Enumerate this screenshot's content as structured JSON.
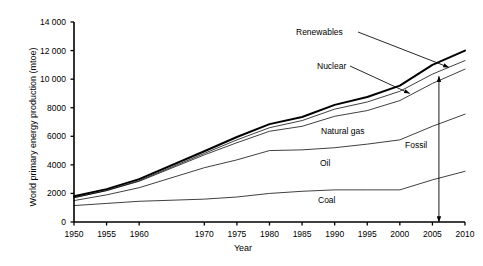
{
  "chart_data": {
    "type": "line",
    "title": "",
    "subtitle": "",
    "xlabel": "Year",
    "ylabel": "World primary energy production (mtoe)",
    "xlim": [
      1950,
      2010
    ],
    "ylim": [
      0,
      14000
    ],
    "grid": false,
    "legend_position": "inline-labels",
    "stacking": "cumulative",
    "x": [
      1950,
      1955,
      1960,
      1970,
      1975,
      1980,
      1985,
      1990,
      1995,
      2000,
      2005,
      2010
    ],
    "xticklabels": [
      "1950",
      "1955",
      "1960",
      "1970",
      "1975",
      "1980",
      "1985",
      "1990",
      "1995",
      "2000",
      "2005",
      "2010"
    ],
    "yticks": [
      0,
      2000,
      4000,
      6000,
      8000,
      10000,
      12000,
      14000
    ],
    "yticklabels": [
      "0",
      "2000",
      "4000",
      "6000",
      "8000",
      "10 000",
      "12 000",
      "14 000"
    ],
    "series": [
      {
        "name": "Coal",
        "label": "Coal",
        "cumulative": true,
        "style": "thin",
        "values": [
          1150,
          1300,
          1450,
          1600,
          1750,
          2000,
          2150,
          2250,
          2250,
          2250,
          2950,
          3550
        ]
      },
      {
        "name": "Oil",
        "label": "Oil",
        "cumulative": true,
        "style": "thin",
        "values": [
          1500,
          1900,
          2400,
          3800,
          4350,
          5000,
          5050,
          5200,
          5450,
          5750,
          6700,
          7550
        ]
      },
      {
        "name": "Natural gas",
        "label": "Natural gas",
        "cumulative": true,
        "style": "thin",
        "values": [
          1700,
          2200,
          2850,
          4700,
          5550,
          6350,
          6700,
          7400,
          7800,
          8500,
          9700,
          10700
        ]
      },
      {
        "name": "Nuclear",
        "label": "Nuclear",
        "cumulative": true,
        "style": "thin",
        "values": [
          1700,
          2200,
          2900,
          4800,
          5750,
          6600,
          7100,
          7900,
          8400,
          9150,
          10350,
          11300
        ]
      },
      {
        "name": "Renewables",
        "label": "Renewables",
        "cumulative": true,
        "style": "thick",
        "values": [
          1800,
          2300,
          3000,
          4950,
          5950,
          6850,
          7350,
          8200,
          8750,
          9550,
          11000,
          12000
        ]
      }
    ],
    "annotations": [
      {
        "name": "fossil-bracket",
        "text": "Fossil",
        "kind": "double-headed-arrow",
        "x": 2006,
        "y_from": 0,
        "y_to": 10200
      }
    ]
  },
  "axes": {
    "y_title": "World primary energy production (mtoe)",
    "x_title": "Year"
  },
  "labels": {
    "renewables": "Renewables",
    "nuclear": "Nuclear",
    "natural_gas": "Natural gas",
    "oil": "Oil",
    "coal": "Coal",
    "fossil": "Fossil"
  },
  "colors": {
    "line": "#000000",
    "background": "#ffffff",
    "text": "#000000"
  }
}
